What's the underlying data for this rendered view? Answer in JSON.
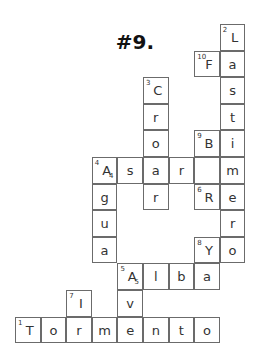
{
  "title": "#9.",
  "grid": {
    "origin_x": 15,
    "origin_y": 24,
    "cell_w": 25.6,
    "cell_h": 26.6,
    "cells": [
      {
        "c": 8,
        "r": 0,
        "letter": "L",
        "num": "2"
      },
      {
        "c": 8,
        "r": 1,
        "letter": "a"
      },
      {
        "c": 8,
        "r": 2,
        "letter": "s"
      },
      {
        "c": 8,
        "r": 3,
        "letter": "t"
      },
      {
        "c": 8,
        "r": 4,
        "letter": "i"
      },
      {
        "c": 8,
        "r": 5,
        "letter": "m"
      },
      {
        "c": 8,
        "r": 6,
        "letter": "e"
      },
      {
        "c": 8,
        "r": 7,
        "letter": "r"
      },
      {
        "c": 8,
        "r": 8,
        "letter": "o"
      },
      {
        "c": 7,
        "r": 1,
        "letter": "F",
        "num": "10"
      },
      {
        "c": 5,
        "r": 2,
        "letter": "C",
        "num": "3"
      },
      {
        "c": 5,
        "r": 3,
        "letter": "r"
      },
      {
        "c": 5,
        "r": 4,
        "letter": "o"
      },
      {
        "c": 7,
        "r": 4,
        "letter": "B",
        "num": "9"
      },
      {
        "c": 3,
        "r": 5,
        "letter": "A",
        "num": "4",
        "sub": "4"
      },
      {
        "c": 4,
        "r": 5,
        "letter": "s"
      },
      {
        "c": 5,
        "r": 5,
        "letter": "a"
      },
      {
        "c": 6,
        "r": 5,
        "letter": "r"
      },
      {
        "c": 7,
        "r": 5,
        "letter": ""
      },
      {
        "c": 3,
        "r": 6,
        "letter": "g"
      },
      {
        "c": 5,
        "r": 6,
        "letter": "r"
      },
      {
        "c": 7,
        "r": 6,
        "letter": "R",
        "num": "6"
      },
      {
        "c": 3,
        "r": 7,
        "letter": "u"
      },
      {
        "c": 3,
        "r": 8,
        "letter": "a"
      },
      {
        "c": 7,
        "r": 8,
        "letter": "Y",
        "num": "8"
      },
      {
        "c": 4,
        "r": 9,
        "letter": "A",
        "num": "5",
        "sub": "5"
      },
      {
        "c": 5,
        "r": 9,
        "letter": "l"
      },
      {
        "c": 6,
        "r": 9,
        "letter": "b"
      },
      {
        "c": 7,
        "r": 9,
        "letter": "a"
      },
      {
        "c": 2,
        "r": 10,
        "letter": "I",
        "num": "7"
      },
      {
        "c": 4,
        "r": 10,
        "letter": "v"
      },
      {
        "c": 0,
        "r": 11,
        "letter": "T",
        "num": "1"
      },
      {
        "c": 1,
        "r": 11,
        "letter": "o"
      },
      {
        "c": 2,
        "r": 11,
        "letter": "r"
      },
      {
        "c": 3,
        "r": 11,
        "letter": "m"
      },
      {
        "c": 4,
        "r": 11,
        "letter": "e"
      },
      {
        "c": 5,
        "r": 11,
        "letter": "n"
      },
      {
        "c": 6,
        "r": 11,
        "letter": "t"
      },
      {
        "c": 7,
        "r": 11,
        "letter": "o"
      }
    ]
  },
  "words": {
    "1": "Tormento",
    "2": "Lastimero",
    "3": "Croar",
    "4": "Asar / Agua",
    "5": "Alba / Av",
    "6": "R",
    "7": "Ir",
    "8": "Ya",
    "9": "B",
    "10": "F"
  }
}
